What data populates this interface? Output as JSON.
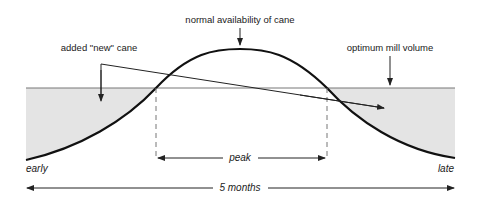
{
  "diagram": {
    "labels": {
      "normal_availability": "normal availability of cane",
      "added_new_cane": "added \"new\" cane",
      "optimum_mill_volume": "optimum mill volume",
      "early": "early",
      "late": "late",
      "peak": "peak",
      "duration": "5 months"
    },
    "colors": {
      "curve": "#111111",
      "shade": "#e4e4e4",
      "mill_line": "#777777",
      "annotation": "#222222"
    }
  }
}
